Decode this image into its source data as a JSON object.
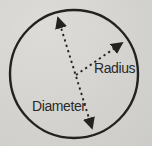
{
  "figure": {
    "type": "circle-diagram",
    "labels": {
      "radius": "Radius",
      "diameter": "Diameter"
    },
    "colors": {
      "background": "#d5d4d0",
      "ink": "#232220"
    }
  }
}
